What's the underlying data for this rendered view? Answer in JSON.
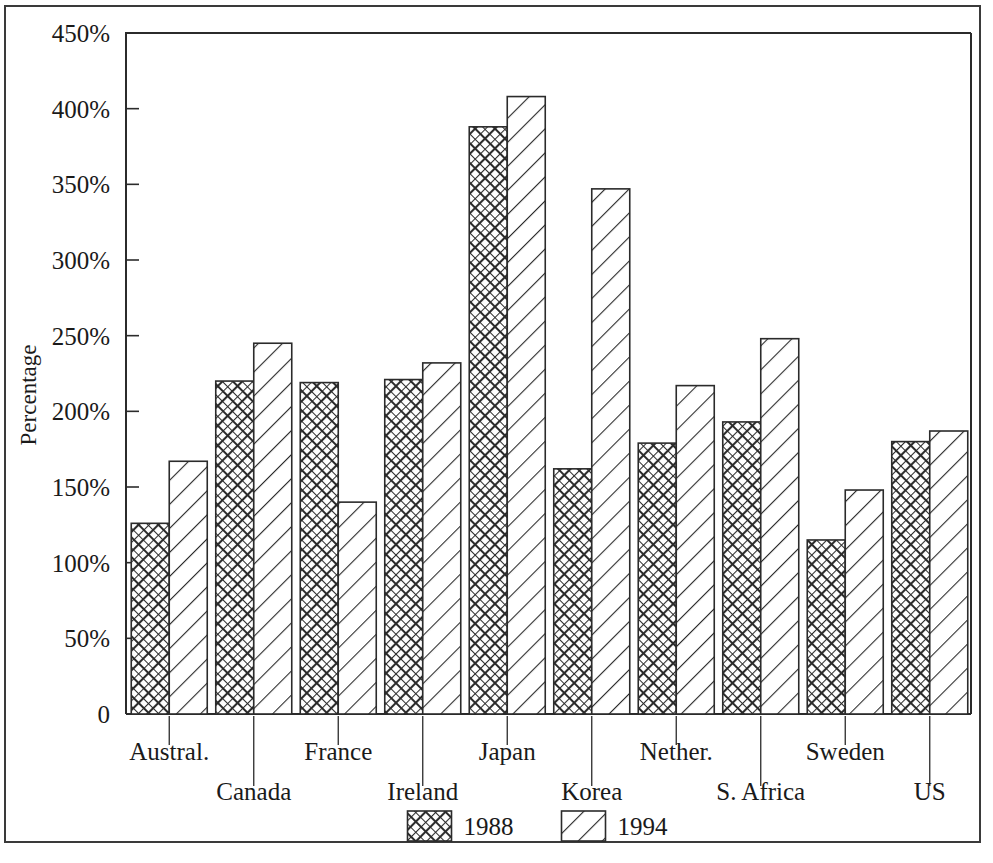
{
  "chart_data": {
    "type": "bar",
    "title": "",
    "xlabel": "",
    "ylabel": "Percentage",
    "ylim": [
      0,
      450
    ],
    "ytick_values": [
      0,
      50,
      100,
      150,
      200,
      250,
      300,
      350,
      400,
      450
    ],
    "ytick_labels": [
      "0",
      "50%",
      "100%",
      "150%",
      "200%",
      "250%",
      "300%",
      "350%",
      "400%",
      "450%"
    ],
    "grid": false,
    "legend_position": "bottom-center",
    "categories": [
      "Austral.",
      "Canada",
      "France",
      "Ireland",
      "Japan",
      "Korea",
      "Nether.",
      "S. Africa",
      "Sweden",
      "US"
    ],
    "series": [
      {
        "name": "1988",
        "pattern": "cross-hatch",
        "values": [
          126,
          220,
          219,
          221,
          388,
          162,
          179,
          193,
          115,
          180
        ]
      },
      {
        "name": "1994",
        "pattern": "diagonal-hatch",
        "values": [
          167,
          245,
          140,
          232,
          408,
          347,
          217,
          248,
          148,
          187
        ]
      }
    ],
    "legend": [
      {
        "label": "1988",
        "pattern": "cross-hatch"
      },
      {
        "label": "1994",
        "pattern": "diagonal-hatch"
      }
    ],
    "colors": {
      "axis": "#2b2b2b",
      "bar_outline": "#2b2b2b",
      "bar_fill": "#ffffff",
      "hatch": "#2b2b2b",
      "frame": "#3a3a3a",
      "background": "#ffffff"
    }
  }
}
